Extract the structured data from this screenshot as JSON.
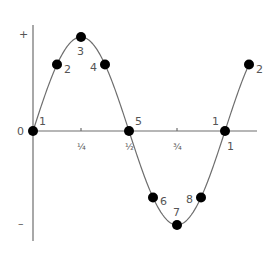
{
  "chart_data": {
    "type": "line",
    "title": "",
    "xlabel": "",
    "ylabel": "",
    "function": "sine",
    "xlim": [
      0,
      1.15
    ],
    "ylim": [
      -1,
      1
    ],
    "y_tick_labels": [
      {
        "value": 1,
        "label": "+"
      },
      {
        "value": 0,
        "label": "0"
      },
      {
        "value": -1,
        "label": "–"
      }
    ],
    "x_ticks": [
      {
        "value": 0.25,
        "label": "¼"
      },
      {
        "value": 0.5,
        "label": "½"
      },
      {
        "value": 0.75,
        "label": "¾"
      },
      {
        "value": 1,
        "label": "1"
      }
    ],
    "points": [
      {
        "x": 0,
        "y": 0,
        "label": "1",
        "label_pos": "upper-right"
      },
      {
        "x": 0.125,
        "y": 0.707,
        "label": "2",
        "label_pos": "right"
      },
      {
        "x": 0.25,
        "y": 1,
        "label": "3",
        "label_pos": "below"
      },
      {
        "x": 0.375,
        "y": 0.707,
        "label": "4",
        "label_pos": "left"
      },
      {
        "x": 0.5,
        "y": 0,
        "label": "5",
        "label_pos": "upper-right"
      },
      {
        "x": 0.625,
        "y": -0.707,
        "label": "6",
        "label_pos": "right"
      },
      {
        "x": 0.75,
        "y": -1,
        "label": "7",
        "label_pos": "above"
      },
      {
        "x": 0.875,
        "y": -0.707,
        "label": "8",
        "label_pos": "left"
      },
      {
        "x": 1,
        "y": 0,
        "label": "1",
        "label_pos": "upper-left"
      },
      {
        "x": 1.125,
        "y": 0.707,
        "label": "2",
        "label_pos": "right"
      }
    ],
    "grid": false,
    "legend": "none"
  }
}
